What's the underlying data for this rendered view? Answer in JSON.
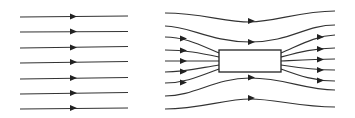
{
  "diagram": {
    "title": "",
    "left_panel": {
      "description": "uniform field lines",
      "line_count": 7,
      "line_color": "#333333",
      "arrow_direction": "right"
    },
    "right_panel": {
      "description": "field lines converging into and diverging out of a rectangular object",
      "object": "rectangle",
      "line_color": "#333333",
      "arrow_direction": "right"
    }
  }
}
